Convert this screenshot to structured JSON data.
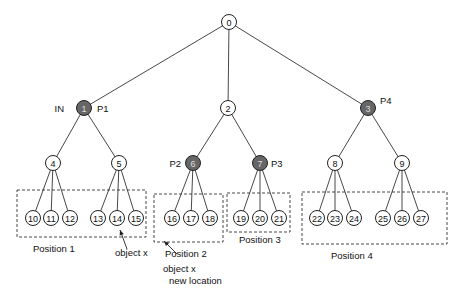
{
  "nodes": [
    {
      "id": "0",
      "x": 229,
      "y": 22,
      "filled": false
    },
    {
      "id": "1",
      "x": 84,
      "y": 108,
      "filled": true
    },
    {
      "id": "2",
      "x": 228,
      "y": 108,
      "filled": false
    },
    {
      "id": "3",
      "x": 368,
      "y": 108,
      "filled": true
    },
    {
      "id": "4",
      "x": 53,
      "y": 163,
      "filled": false
    },
    {
      "id": "5",
      "x": 119,
      "y": 163,
      "filled": false
    },
    {
      "id": "6",
      "x": 193,
      "y": 163,
      "filled": true
    },
    {
      "id": "7",
      "x": 260,
      "y": 163,
      "filled": true
    },
    {
      "id": "8",
      "x": 335,
      "y": 163,
      "filled": false
    },
    {
      "id": "9",
      "x": 402,
      "y": 163,
      "filled": false
    },
    {
      "id": "10",
      "x": 33,
      "y": 218,
      "filled": false
    },
    {
      "id": "11",
      "x": 51,
      "y": 218,
      "filled": false
    },
    {
      "id": "12",
      "x": 70,
      "y": 218,
      "filled": false
    },
    {
      "id": "13",
      "x": 98,
      "y": 218,
      "filled": false
    },
    {
      "id": "14",
      "x": 117,
      "y": 218,
      "filled": false
    },
    {
      "id": "15",
      "x": 136,
      "y": 218,
      "filled": false
    },
    {
      "id": "16",
      "x": 172,
      "y": 218,
      "filled": false
    },
    {
      "id": "17",
      "x": 191,
      "y": 218,
      "filled": false
    },
    {
      "id": "18",
      "x": 210,
      "y": 218,
      "filled": false
    },
    {
      "id": "19",
      "x": 241,
      "y": 218,
      "filled": false
    },
    {
      "id": "20",
      "x": 260,
      "y": 218,
      "filled": false
    },
    {
      "id": "21",
      "x": 279,
      "y": 218,
      "filled": false
    },
    {
      "id": "22",
      "x": 317,
      "y": 218,
      "filled": false
    },
    {
      "id": "23",
      "x": 335,
      "y": 218,
      "filled": false
    },
    {
      "id": "24",
      "x": 354,
      "y": 218,
      "filled": false
    },
    {
      "id": "25",
      "x": 383,
      "y": 218,
      "filled": false
    },
    {
      "id": "26",
      "x": 402,
      "y": 218,
      "filled": false
    },
    {
      "id": "27",
      "x": 421,
      "y": 218,
      "filled": false
    }
  ],
  "edges": [
    [
      "0",
      "1"
    ],
    [
      "0",
      "2"
    ],
    [
      "0",
      "3"
    ],
    [
      "1",
      "4"
    ],
    [
      "1",
      "5"
    ],
    [
      "2",
      "6"
    ],
    [
      "2",
      "7"
    ],
    [
      "3",
      "8"
    ],
    [
      "3",
      "9"
    ],
    [
      "4",
      "10"
    ],
    [
      "4",
      "11"
    ],
    [
      "4",
      "12"
    ],
    [
      "5",
      "13"
    ],
    [
      "5",
      "14"
    ],
    [
      "5",
      "15"
    ],
    [
      "6",
      "16"
    ],
    [
      "6",
      "17"
    ],
    [
      "6",
      "18"
    ],
    [
      "7",
      "19"
    ],
    [
      "7",
      "20"
    ],
    [
      "7",
      "21"
    ],
    [
      "8",
      "22"
    ],
    [
      "8",
      "23"
    ],
    [
      "8",
      "24"
    ],
    [
      "9",
      "25"
    ],
    [
      "9",
      "26"
    ],
    [
      "9",
      "27"
    ]
  ],
  "node_tags": [
    {
      "text": "IN",
      "x": 64,
      "y": 112,
      "anchor": "end"
    },
    {
      "text": "P1",
      "x": 97,
      "y": 112,
      "anchor": "start"
    },
    {
      "text": "P4",
      "x": 380,
      "y": 104,
      "anchor": "start"
    },
    {
      "text": "P2",
      "x": 181,
      "y": 167,
      "anchor": "end"
    },
    {
      "text": "P3",
      "x": 271,
      "y": 167,
      "anchor": "start"
    }
  ],
  "positions": [
    {
      "label": "Position 1",
      "x": 17,
      "y": 190,
      "w": 129,
      "h": 47,
      "lx": 33,
      "ly": 252
    },
    {
      "label": "Position 2",
      "x": 154,
      "y": 194,
      "w": 69,
      "h": 48,
      "lx": 165,
      "ly": 257
    },
    {
      "label": "Position 3",
      "x": 227,
      "y": 193,
      "w": 63,
      "h": 39,
      "lx": 239,
      "ly": 243
    },
    {
      "label": "Position 4",
      "x": 302,
      "y": 192,
      "w": 145,
      "h": 52,
      "lx": 331,
      "ly": 259
    }
  ],
  "annotations": {
    "object_x": {
      "text": "object x",
      "x": 115,
      "y": 256
    },
    "object_x_new_line1": {
      "text": "object x",
      "x": 163,
      "y": 272
    },
    "object_x_new_line2": {
      "text": "new location",
      "x": 169,
      "y": 284
    }
  },
  "arrows": [
    {
      "x1": 127,
      "y1": 249,
      "x2": 120,
      "y2": 230
    },
    {
      "x1": 177,
      "y1": 254,
      "x2": 164,
      "y2": 241
    }
  ]
}
